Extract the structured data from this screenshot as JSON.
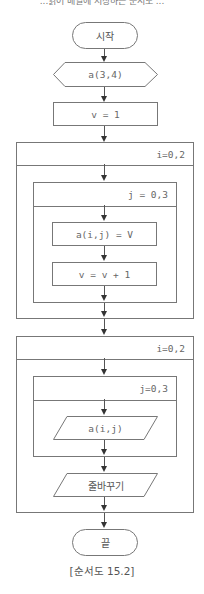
{
  "top_text": "...읽어 배열에 저장하는 순서도 ...",
  "flowchart": {
    "start": "시작",
    "declare": "a(3,4)",
    "init": "v = 1",
    "loop1_outer": "i=0,2",
    "loop1_inner": "j = 0,3",
    "assign": "a(i,j) = V",
    "increment": "v = v + 1",
    "loop2_outer": "i=0,2",
    "loop2_inner": "j=0,3",
    "output": "a(i,j)",
    "newline": "줄바꾸기",
    "end": "끝"
  },
  "caption": "[순서도 15.2]",
  "colors": {
    "line": "#777777",
    "arrow": "#333333",
    "text": "#555555",
    "background": "#ffffff"
  }
}
